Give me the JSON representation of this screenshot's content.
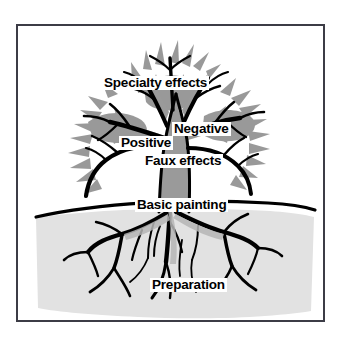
{
  "figure": {
    "type": "tree-hierarchy-diagram",
    "frame_border_color": "#3c3c46",
    "background_color": "#ffffff",
    "foliage_color": "#999999",
    "trunk_color": "#9a9a9a",
    "soil_color": "#e2e2e2",
    "line_color": "#000000"
  },
  "labels": {
    "specialty_effects": "Specialty effects",
    "negative": "Negative",
    "positive": "Positive",
    "faux_effects": "Faux effects",
    "basic_painting": "Basic painting",
    "preparation": "Preparation"
  }
}
